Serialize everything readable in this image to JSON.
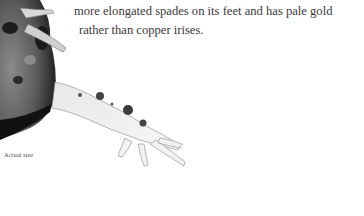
{
  "text": {
    "line1": "more elongated spades on its feet and has pale gold",
    "line2": "rather than copper irises."
  },
  "caption": "Actual size",
  "image": {
    "subject": "frog-photo",
    "style": "grayscale"
  }
}
